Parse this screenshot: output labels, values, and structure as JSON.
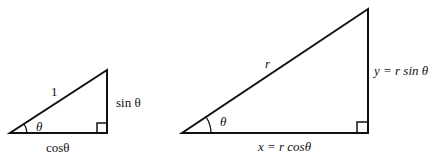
{
  "diagram": {
    "small_triangle": {
      "hypotenuse_label": "1",
      "opposite_label": "sin θ",
      "angle_label": "θ",
      "adjacent_label": "cosθ"
    },
    "large_triangle": {
      "hypotenuse_label": "r",
      "opposite_label": "y = r sin θ",
      "angle_label": "θ",
      "adjacent_label": "x = r cosθ"
    }
  }
}
